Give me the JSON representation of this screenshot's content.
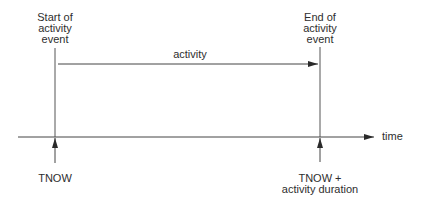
{
  "diagram": {
    "type": "timeline",
    "start_event": {
      "line1": "Start of",
      "line2": "activity",
      "line3": "event"
    },
    "end_event": {
      "line1": "End of",
      "line2": "activity",
      "line3": "event"
    },
    "activity_label": "activity",
    "axis_label": "time",
    "start_marker": {
      "line1": "TNOW"
    },
    "end_marker": {
      "line1": "TNOW +",
      "line2": "activity duration"
    },
    "colors": {
      "line": "#3a3a3a",
      "text": "#2e2e2e",
      "background": "#ffffff"
    }
  }
}
